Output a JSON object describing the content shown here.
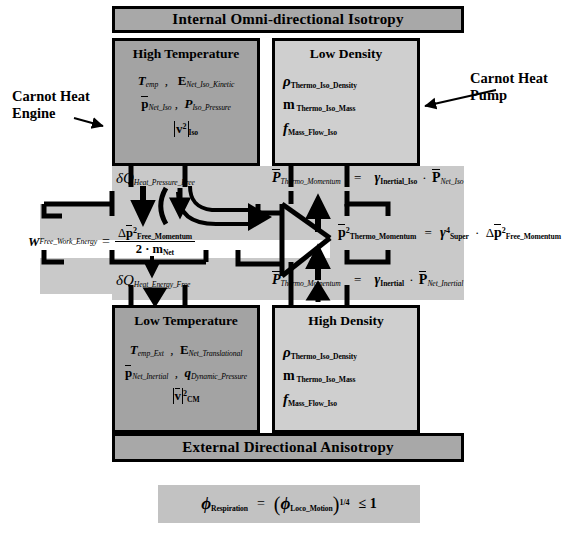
{
  "diagram": {
    "banners": {
      "top": "Internal Omni-directional Isotropy",
      "bottom": "External Directional Anisotropy"
    },
    "side_labels": {
      "left_line1": "Carnot Heat",
      "left_line2": "Engine",
      "right_line1": "Carnot Heat",
      "right_line2": "Pump"
    },
    "quadrants": [
      {
        "id": "high-temperature",
        "title": "High Temperature",
        "shade": "#a3a3a3",
        "rows": [
          {
            "terms": [
              "T_emp",
              "E_Net_Iso_Kinetic"
            ]
          },
          {
            "terms": [
              "p̄_Net_Iso",
              "P_Iso_Pressure"
            ]
          },
          {
            "terms": [
              "|v²|_Iso"
            ]
          }
        ]
      },
      {
        "id": "low-density",
        "title": "Low Density",
        "shade": "#cfcfcf",
        "rows": [
          {
            "terms": [
              "ρ_Thermo_Iso_Density"
            ]
          },
          {
            "terms": [
              "m_Thermo_Iso_Mass"
            ]
          },
          {
            "terms": [
              "f_Mass_Flow_Iso"
            ]
          }
        ]
      },
      {
        "id": "low-temperature",
        "title": "Low Temperature",
        "shade": "#a3a3a3",
        "rows": [
          {
            "terms": [
              "T_emp_Ext",
              "E_Net_Translational"
            ]
          },
          {
            "terms": [
              "p̄_Net_Inertial",
              "q_Dynamic_Pressure"
            ]
          },
          {
            "terms": [
              "|v̄|²_CM"
            ]
          }
        ]
      },
      {
        "id": "high-density",
        "title": "High Density",
        "shade": "#cfcfcf",
        "rows": [
          {
            "terms": [
              "ρ_Thermo_Iso_Density"
            ]
          },
          {
            "terms": [
              "m_Thermo_Iso_Mass"
            ]
          },
          {
            "terms": [
              "f_Mass_Flow_Iso"
            ]
          }
        ]
      }
    ],
    "flow_labels": {
      "heat_pressure_free": "δQ_Heat_Pressure_Free",
      "heat_energy_free": "δQ_Heat_Energy_Free"
    },
    "equations": {
      "work": {
        "lhs": "W_Free_Work_Energy",
        "numerator": "Δp̄²_Free_Momentum",
        "denominator": "2 · m_Net"
      },
      "momentum_top": {
        "lhs": "P̄_Thermo_Momentum",
        "rhs": "γ_Inertial_Iso · P̄_Net_Iso"
      },
      "momentum_mid": {
        "lhs": "p̄²_Thermo_Momentum",
        "rhs": "γ⁴_Super · Δp̄²_Free_Momentum"
      },
      "momentum_bottom": {
        "lhs": "P̄_Thermo_Momentum",
        "rhs": "γ_Inertial · P̄_Net_Inertial"
      }
    },
    "bottom_formula": {
      "lhs": "ϕ_Respiration",
      "rhs": "(ϕ_Loco_Motion)^(1/4) ≤ 1"
    },
    "colors": {
      "banner": "#a8a8a8",
      "dark_box": "#a3a3a3",
      "light_box": "#cfcfcf",
      "band": "#c9c9c9",
      "formula_strip": "#c2c2c2",
      "stroke": "#000000"
    }
  }
}
